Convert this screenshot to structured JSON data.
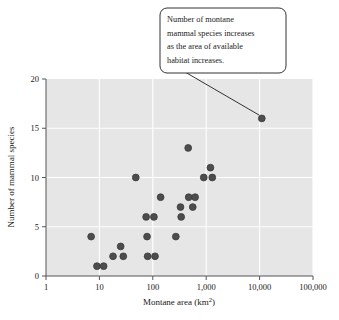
{
  "chart_data": {
    "type": "scatter",
    "title": "",
    "xlabel": "Montane area (km²)",
    "ylabel": "Number of mammal species",
    "x_scale": "log",
    "y_scale": "linear",
    "xlim": [
      1,
      100000
    ],
    "ylim": [
      0,
      20
    ],
    "x_ticks": [
      1,
      10,
      100,
      1000,
      10000,
      100000
    ],
    "x_tick_labels": [
      "1",
      "10",
      "100",
      "1,000",
      "10,000",
      "100,000"
    ],
    "y_ticks": [
      0,
      5,
      10,
      15,
      20
    ],
    "y_tick_labels": [
      "0",
      "5",
      "10",
      "15",
      "20"
    ],
    "grid": true,
    "legend": "none",
    "plot_background": "#e6e6e6",
    "point_color": "#4d4d4d",
    "point_edge_color": "#3a3a3a",
    "point_radius": 3.4,
    "points": [
      {
        "x": 7,
        "y": 4
      },
      {
        "x": 9,
        "y": 1
      },
      {
        "x": 12,
        "y": 1
      },
      {
        "x": 18,
        "y": 2
      },
      {
        "x": 25,
        "y": 3
      },
      {
        "x": 28,
        "y": 2
      },
      {
        "x": 48,
        "y": 10
      },
      {
        "x": 75,
        "y": 6
      },
      {
        "x": 78,
        "y": 4
      },
      {
        "x": 80,
        "y": 2
      },
      {
        "x": 105,
        "y": 6
      },
      {
        "x": 110,
        "y": 2
      },
      {
        "x": 140,
        "y": 8
      },
      {
        "x": 270,
        "y": 4
      },
      {
        "x": 330,
        "y": 7
      },
      {
        "x": 340,
        "y": 6
      },
      {
        "x": 460,
        "y": 13
      },
      {
        "x": 470,
        "y": 8
      },
      {
        "x": 560,
        "y": 7
      },
      {
        "x": 620,
        "y": 8
      },
      {
        "x": 900,
        "y": 10
      },
      {
        "x": 1200,
        "y": 11
      },
      {
        "x": 1300,
        "y": 10
      },
      {
        "x": 11000,
        "y": 16
      }
    ]
  },
  "annotation": {
    "name": "callout-note",
    "lines": [
      "Number of montane",
      "mammal species increases",
      "as the area of available",
      "habitat increases."
    ],
    "target_point": {
      "x": 11000,
      "y": 16
    },
    "border_color": "#333333",
    "background": "#ffffff"
  }
}
